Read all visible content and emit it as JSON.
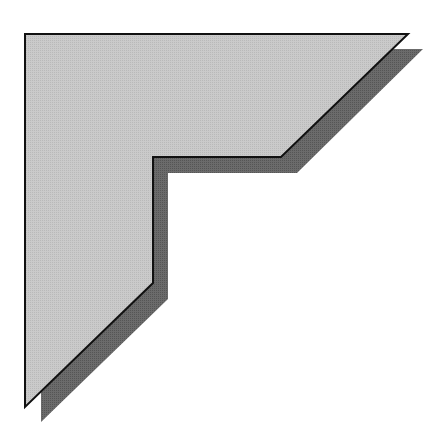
{
  "figure": {
    "width": 443,
    "height": 443,
    "background": "#ffffff",
    "colors": {
      "main_fill": "#c6c6c6",
      "shadow_fill": "#666666",
      "outline": "#111111"
    },
    "main_shape_points": "25,34 408,34 281,157 153,157 153,283 25,407",
    "shadow_shape_points": "41,49 423,49 297,173 168,173 168,299 41,422"
  }
}
